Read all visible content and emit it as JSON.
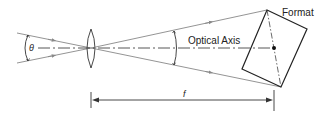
{
  "diagram": {
    "labels": {
      "format": "Format",
      "optical_axis": "Optical Axis",
      "theta": "θ",
      "focal_length": "f"
    },
    "colors": {
      "rays": "#888888",
      "lines": "#333333",
      "background": "#ffffff"
    }
  }
}
